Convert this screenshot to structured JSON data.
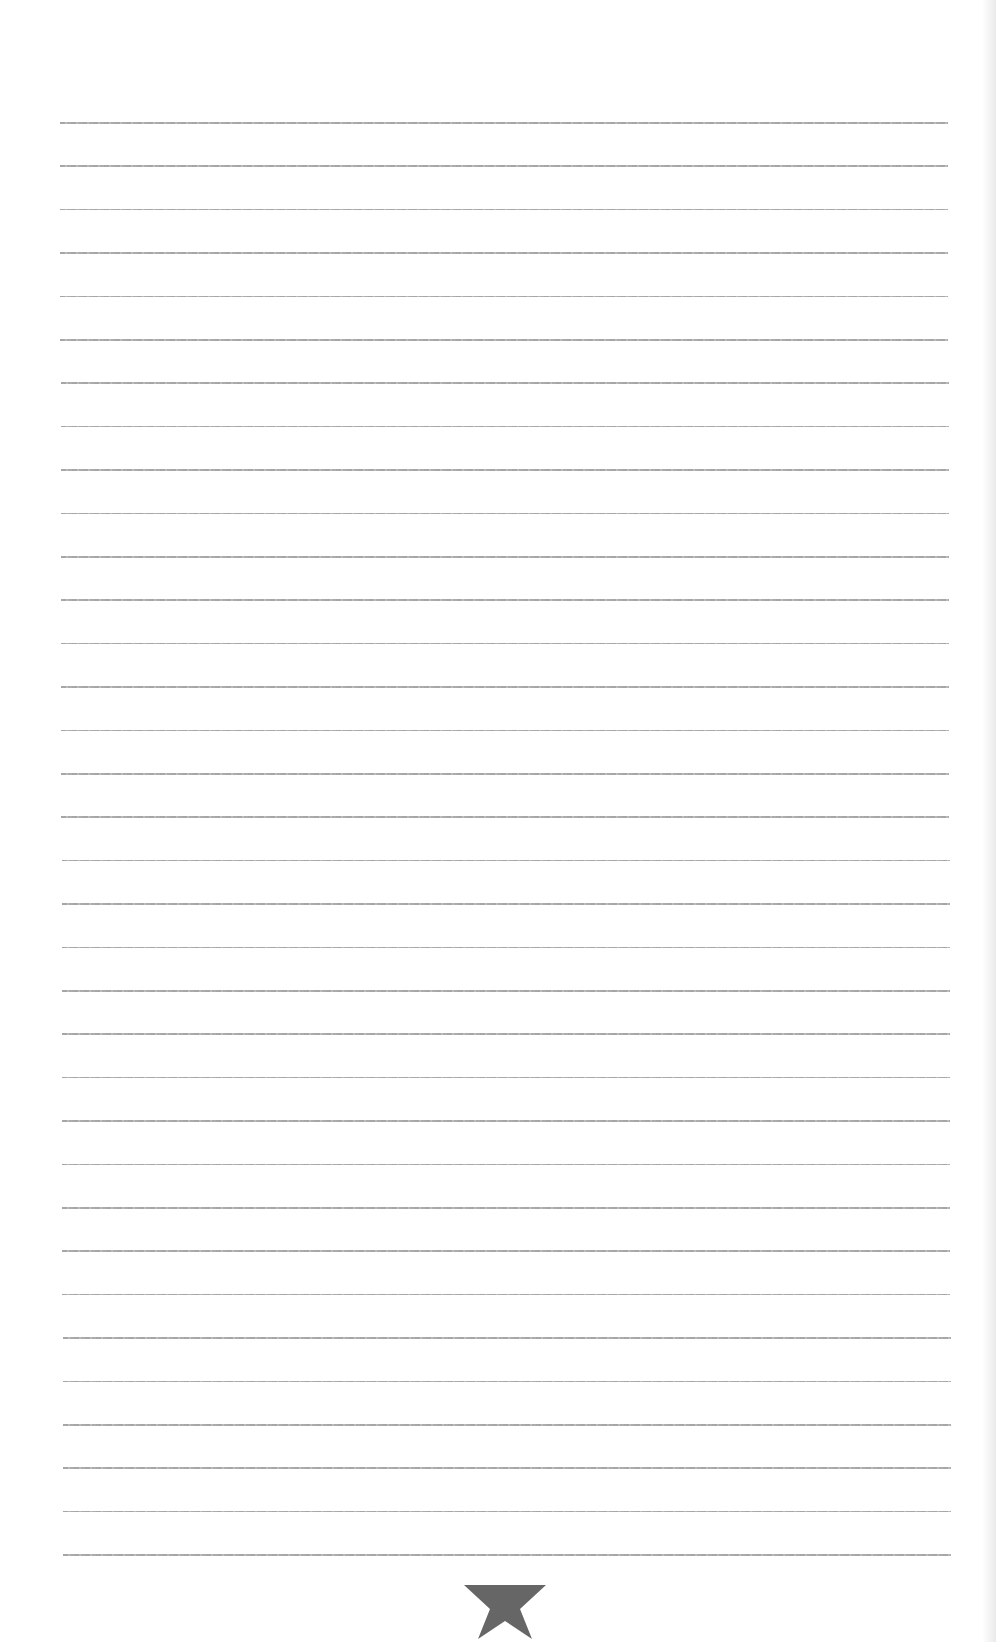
{
  "page": {
    "type": "ruled-sheet",
    "background_color": "#ffffff",
    "line_color": "#a0a0a0",
    "line_count": 34,
    "first_line_y": 122,
    "line_spacing": 43.4,
    "line_left": 60,
    "line_right": 948
  },
  "ornament": {
    "icon": "star-icon",
    "color": "#666666"
  }
}
